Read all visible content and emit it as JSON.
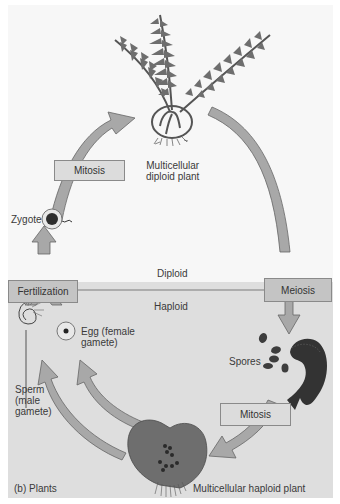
{
  "figure": {
    "caption": "(b) Plants",
    "regions": {
      "diploid": "Diploid",
      "haploid": "Haploid"
    },
    "processes": {
      "mitosis_top": "Mitosis",
      "fertilization": "Fertilization",
      "meiosis": "Meiosis",
      "mitosis_bottom": "Mitosis"
    },
    "labels": {
      "diploid_plant_line1": "Multicellular",
      "diploid_plant_line2": "diploid plant",
      "zygote": "Zygote",
      "egg_line1": "Egg (female",
      "egg_line2": "gamete)",
      "sperm_line1": "Sperm",
      "sperm_line2": "(male",
      "sperm_line3": "gamete)",
      "spores": "Spores",
      "haploid_plant": "Multicellular haploid plant"
    },
    "colors": {
      "diploid_bg": "#f7f7f7",
      "haploid_bg": "#dedede",
      "arrow_fill": "#a8a8a8",
      "arrow_stroke": "#666666",
      "box_fill": "#c4c4c4",
      "plant_fill": "#6e6e6e"
    }
  }
}
